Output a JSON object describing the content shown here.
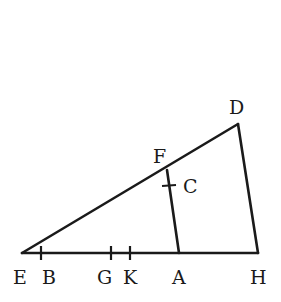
{
  "diagram": {
    "type": "geometric-figure",
    "stroke_color": "#1a1a1a",
    "background": "#ffffff",
    "points": {
      "E": {
        "label": "E",
        "x": 22,
        "y": 253
      },
      "B": {
        "label": "B",
        "x": 41,
        "y": 253
      },
      "G": {
        "label": "G",
        "x": 111,
        "y": 253
      },
      "K": {
        "label": "K",
        "x": 130,
        "y": 253
      },
      "A": {
        "label": "A",
        "x": 179,
        "y": 253
      },
      "H": {
        "label": "H",
        "x": 258,
        "y": 253
      },
      "D": {
        "label": "D",
        "x": 238,
        "y": 124
      },
      "F": {
        "label": "F",
        "x": 167,
        "y": 170
      },
      "C": {
        "label": "C",
        "x": 169,
        "y": 185
      }
    },
    "segments": [
      {
        "from": "E",
        "to": "H"
      },
      {
        "from": "E",
        "to": "D"
      },
      {
        "from": "D",
        "to": "H"
      },
      {
        "from": "F",
        "to": "A"
      }
    ],
    "tick_marks": [
      "B",
      "G",
      "K",
      "C"
    ]
  }
}
